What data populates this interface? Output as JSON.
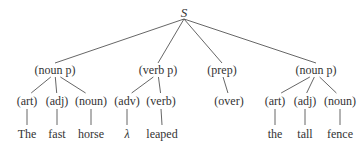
{
  "diagram": {
    "type": "parse-tree",
    "root": {
      "label": "S",
      "x": 184,
      "y": 12
    },
    "phrases": [
      {
        "label": "(noun p)",
        "x": 55,
        "y": 70
      },
      {
        "label": "(verb p)",
        "x": 158,
        "y": 70
      },
      {
        "label": "(prep)",
        "x": 222,
        "y": 70
      },
      {
        "label": "(noun p)",
        "x": 316,
        "y": 70
      }
    ],
    "tags": [
      {
        "label": "(art)",
        "x": 27,
        "y": 101,
        "parent": 0
      },
      {
        "label": "(adj)",
        "x": 57,
        "y": 101,
        "parent": 0
      },
      {
        "label": "(noun)",
        "x": 91,
        "y": 101,
        "parent": 0
      },
      {
        "label": "(adv)",
        "x": 127,
        "y": 101,
        "parent": 1
      },
      {
        "label": "(verb)",
        "x": 161,
        "y": 101,
        "parent": 1
      },
      {
        "label": "(over)",
        "x": 229,
        "y": 101,
        "parent": 2
      },
      {
        "label": "(art)",
        "x": 275,
        "y": 101,
        "parent": 3
      },
      {
        "label": "(adj)",
        "x": 305,
        "y": 101,
        "parent": 3
      },
      {
        "label": "(noun)",
        "x": 340,
        "y": 101,
        "parent": 3
      }
    ],
    "words": [
      {
        "label": "The",
        "x": 27,
        "y": 134,
        "tag": 0
      },
      {
        "label": "fast",
        "x": 57,
        "y": 134,
        "tag": 1
      },
      {
        "label": "horse",
        "x": 91,
        "y": 134,
        "tag": 2
      },
      {
        "label": "λ",
        "x": 127,
        "y": 134,
        "tag": 3
      },
      {
        "label": "leaped",
        "x": 162,
        "y": 134,
        "tag": 4
      },
      {
        "label": "the",
        "x": 275,
        "y": 134,
        "tag": 6
      },
      {
        "label": "tall",
        "x": 305,
        "y": 134,
        "tag": 7
      },
      {
        "label": "fence",
        "x": 340,
        "y": 134,
        "tag": 8
      }
    ],
    "line_color": "#555555",
    "text_color": "#333333"
  }
}
